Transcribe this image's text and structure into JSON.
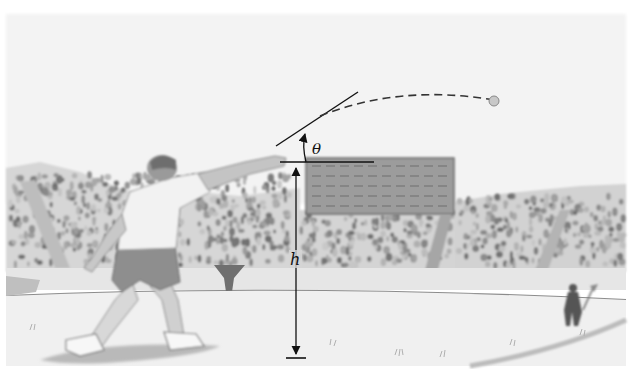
{
  "figure": {
    "labels": {
      "angle": "θ",
      "height": "h"
    },
    "elements": [
      {
        "name": "athlete",
        "description": "shot-putter in follow-through pose, arm extended"
      },
      {
        "name": "shot-ball",
        "description": "ball in flight at end of dashed trajectory"
      },
      {
        "name": "trajectory",
        "description": "dashed parabolic path of the shot"
      },
      {
        "name": "launch-direction-line",
        "description": "solid line showing initial velocity direction"
      },
      {
        "name": "horizontal-reference-line",
        "description": "horizontal line at release point"
      },
      {
        "name": "angle-arc-arrow",
        "description": "curved arrow indicating launch angle θ"
      },
      {
        "name": "height-dimension-arrow",
        "description": "double-headed vertical arrow from ground to release point, labeled h"
      },
      {
        "name": "scoreboard",
        "description": "dark rectangular board behind release point"
      },
      {
        "name": "stands-crowd",
        "description": "grandstands filled with spectators"
      },
      {
        "name": "field-official",
        "description": "small figure holding a flag/marker on the right"
      }
    ],
    "palette": {
      "sky": "#f4f4f4",
      "crowd_dark": "#8a8a8a",
      "crowd_light": "#c9c9c9",
      "scoreboard": "#9a9a9a",
      "field": "#ededed",
      "ink": "#111111"
    }
  }
}
